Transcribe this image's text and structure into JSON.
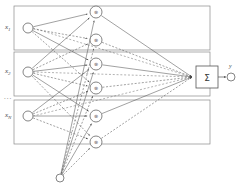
{
  "diagram": {
    "background": "#ffffff",
    "line_color": "#555555",
    "node_stroke": "#666666",
    "box_stroke": "#777777"
  },
  "inputs": {
    "group_label": "inputs",
    "items": [
      {
        "name": "input-x1",
        "base": "x",
        "sub": "1",
        "cx": 28,
        "cy": 28,
        "r": 5
      },
      {
        "name": "input-x2",
        "base": "x",
        "sub": "2",
        "cx": 28,
        "cy": 72,
        "r": 5
      },
      {
        "name": "input-xN",
        "base": "x",
        "sub": "N",
        "cx": 28,
        "cy": 116,
        "r": 5
      }
    ],
    "ellipsis": "..."
  },
  "group_boxes": [
    {
      "name": "input-group-box-1",
      "x": 14,
      "y": 6,
      "w": 196,
      "h": 44
    },
    {
      "name": "input-group-box-2",
      "x": 14,
      "y": 52,
      "w": 196,
      "h": 44
    },
    {
      "name": "input-group-box-3",
      "x": 14,
      "y": 100,
      "w": 196,
      "h": 44
    }
  ],
  "hidden_nodes": {
    "label": "membership nodes",
    "symbol": "⊗",
    "items": [
      {
        "name": "hidden-node-1",
        "cx": 96,
        "cy": 12,
        "r": 6
      },
      {
        "name": "hidden-node-2",
        "cx": 96,
        "cy": 40,
        "r": 6
      },
      {
        "name": "hidden-node-3",
        "cx": 96,
        "cy": 64,
        "r": 6
      },
      {
        "name": "hidden-node-4",
        "cx": 96,
        "cy": 88,
        "r": 6
      },
      {
        "name": "hidden-node-5",
        "cx": 96,
        "cy": 116,
        "r": 6
      },
      {
        "name": "hidden-node-6",
        "cx": 96,
        "cy": 142,
        "r": 6
      }
    ]
  },
  "bias": {
    "name": "bias-fan-origin",
    "cx": 60,
    "cy": 178,
    "r": 4,
    "label": ""
  },
  "summation": {
    "name": "summation-block",
    "symbol": "Σ",
    "x": 196,
    "y": 66,
    "w": 22,
    "h": 22,
    "converge_x": 192,
    "converge_y": 77
  },
  "output": {
    "name": "output-node",
    "base": "y",
    "sub": "",
    "cx": 231,
    "cy": 77,
    "r": 4,
    "arrow_from_x": 218,
    "arrow_to_x": 226
  },
  "edges": {
    "solid_style": "solid",
    "dashed_style": "dashed",
    "arrowheads": "filled-triangle"
  }
}
